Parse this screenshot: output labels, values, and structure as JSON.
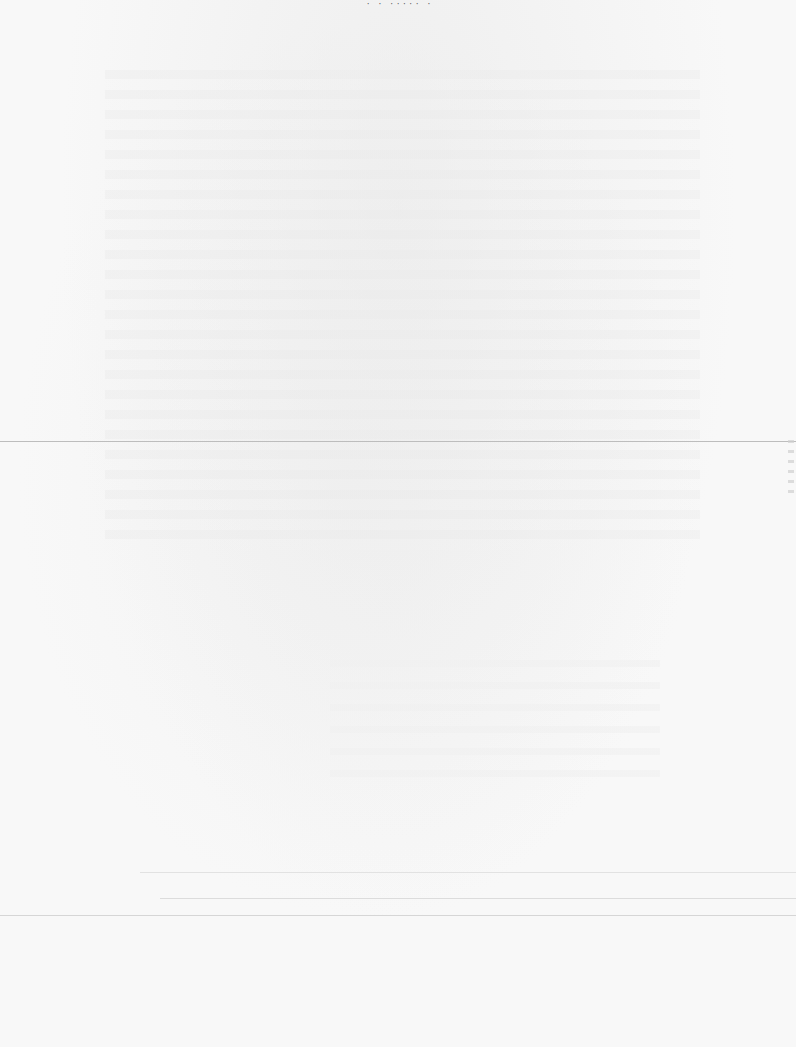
{
  "document": {
    "type": "scanned-page",
    "header_fragment": "· ·  ····· ·",
    "body_text": "",
    "legible_content": false
  }
}
